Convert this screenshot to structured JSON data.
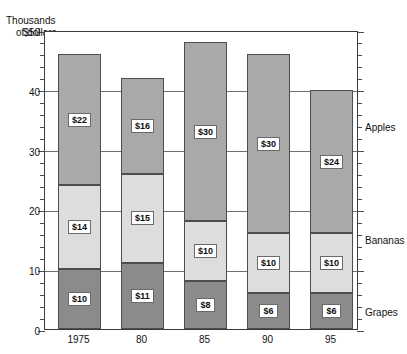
{
  "chart_data": {
    "type": "bar",
    "subtype": "stacked-bar",
    "title": "Thousands of dollars",
    "title_lines": [
      "Thousands",
      "of dollars"
    ],
    "xlabel": "",
    "ylabel": "Thousands of dollars",
    "categories": [
      "1975",
      "80",
      "85",
      "90",
      "95"
    ],
    "series": [
      {
        "name": "Grapes",
        "values": [
          10,
          11,
          8,
          6,
          6
        ],
        "color": "#8b8b8b",
        "labels": [
          "$10",
          "$11",
          "$8",
          "$6",
          "$6"
        ]
      },
      {
        "name": "Bananas",
        "values": [
          14,
          15,
          10,
          10,
          10
        ],
        "color": "#dddddd",
        "labels": [
          "$14",
          "$15",
          "$10",
          "$10",
          "$10"
        ]
      },
      {
        "name": "Apples",
        "values": [
          22,
          16,
          30,
          30,
          24
        ],
        "color": "#a9a9a9",
        "labels": [
          "$22",
          "$16",
          "$30",
          "$30",
          "$24"
        ]
      }
    ],
    "totals": [
      46,
      42,
      48,
      46,
      40
    ],
    "ylim": [
      0,
      50
    ],
    "yticks": [
      0,
      10,
      20,
      30,
      40,
      50
    ],
    "ytick_labels": [
      "0",
      "10",
      "20",
      "30",
      "40",
      "$50"
    ],
    "yminor_step": 2,
    "grid": true,
    "grid_axis": "y",
    "legend_position": "right-inline",
    "legend_entries": [
      {
        "label": "Apples",
        "value_position": 34
      },
      {
        "label": "Bananas",
        "value_position": 15
      },
      {
        "label": "Grapes",
        "value_position": 3
      }
    ]
  }
}
